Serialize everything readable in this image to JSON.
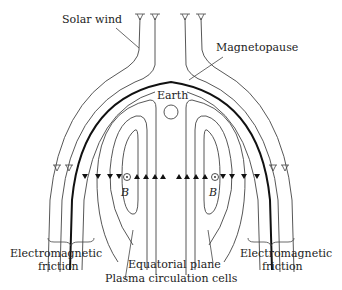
{
  "diagram": {
    "labels": {
      "solar_wind": "Solar wind",
      "magnetopause": "Magnetopause",
      "earth": "Earth",
      "equatorial_plane": "Equatorial plane",
      "plasma_cells": "Plasma circulation cells",
      "em_friction_left_1": "Electromagnetic",
      "em_friction_left_2": "friction",
      "em_friction_right_1": "Electromagnetic",
      "em_friction_right_2": "friction",
      "b_left": "B",
      "b_right": "B"
    },
    "symbols": {
      "field_out_of_page": "circle-dot",
      "flow_arrow": "triangle"
    },
    "colors": {
      "ink": "#444444",
      "magnetopause": "#111111",
      "background": "#ffffff"
    }
  }
}
